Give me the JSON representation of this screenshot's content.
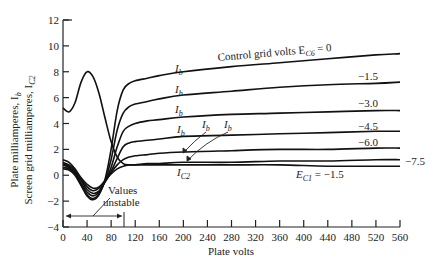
{
  "chart_data": {
    "type": "line",
    "title": "",
    "xlabel": "Plate volts",
    "ylabel_lines": [
      "Plate milliamperes, I_b",
      "Screen grid milliamperes, I_C2"
    ],
    "xlim": [
      0,
      560
    ],
    "ylim": [
      -4,
      12
    ],
    "x_ticks": [
      0,
      40,
      80,
      120,
      160,
      200,
      240,
      280,
      320,
      360,
      400,
      440,
      480,
      520,
      560
    ],
    "y_ticks": [
      -4,
      -2,
      0,
      2,
      4,
      6,
      8,
      10,
      12
    ],
    "grid": false,
    "legend": "inline labels",
    "x": [
      0,
      10,
      20,
      30,
      40,
      50,
      60,
      70,
      80,
      90,
      100,
      110,
      120,
      140,
      160,
      200,
      280,
      360,
      440,
      520,
      560
    ],
    "series": [
      {
        "name": "E_C6 = 0",
        "label": "Control grid volts E_C6 = 0",
        "values": [
          0.5,
          0.4,
          0.0,
          -0.8,
          -1.6,
          -1.9,
          -1.5,
          -0.3,
          2.0,
          5.0,
          6.6,
          7.1,
          7.3,
          7.5,
          7.7,
          8.0,
          8.4,
          8.7,
          9.0,
          9.3,
          9.4
        ]
      },
      {
        "name": "E_C6 = -1.5",
        "label": "-1.5",
        "values": [
          0.6,
          0.5,
          0.1,
          -0.7,
          -1.5,
          -1.8,
          -1.4,
          -0.4,
          1.2,
          3.5,
          4.8,
          5.3,
          5.5,
          5.7,
          5.9,
          6.2,
          6.5,
          6.8,
          7.0,
          7.1,
          7.2
        ]
      },
      {
        "name": "E_C6 = -3.0",
        "label": "-3.0",
        "values": [
          0.8,
          0.6,
          0.2,
          -0.6,
          -1.3,
          -1.6,
          -1.3,
          -0.5,
          0.6,
          2.2,
          3.4,
          3.8,
          4.0,
          4.2,
          4.3,
          4.5,
          4.7,
          4.8,
          4.9,
          5.0,
          5.0
        ]
      },
      {
        "name": "E_C6 = -4.5",
        "label": "-4.5",
        "values": [
          0.9,
          0.7,
          0.3,
          -0.4,
          -1.1,
          -1.4,
          -1.2,
          -0.5,
          0.3,
          1.3,
          2.2,
          2.5,
          2.6,
          2.7,
          2.8,
          3.0,
          3.1,
          3.2,
          3.3,
          3.4,
          3.4
        ]
      },
      {
        "name": "E_C6 = -6.0",
        "label": "-6.0",
        "values": [
          1.0,
          0.8,
          0.4,
          -0.3,
          -0.9,
          -1.2,
          -1.0,
          -0.5,
          0.2,
          0.8,
          1.2,
          1.4,
          1.5,
          1.6,
          1.7,
          1.8,
          1.9,
          2.0,
          2.0,
          2.1,
          2.1
        ]
      },
      {
        "name": "E_C6 = -7.5",
        "label": "-7.5",
        "values": [
          1.2,
          1.0,
          0.5,
          -0.2,
          -0.7,
          -1.0,
          -0.9,
          -0.4,
          0.1,
          0.5,
          0.7,
          0.8,
          0.8,
          0.9,
          0.9,
          1.0,
          1.0,
          1.1,
          1.1,
          1.2,
          1.2
        ]
      },
      {
        "name": "I_C2 (E_C1 = -1.5)",
        "label": "E_C1 = -1.5",
        "values": [
          5.2,
          4.9,
          5.6,
          7.2,
          8.0,
          7.6,
          6.3,
          4.4,
          2.6,
          1.4,
          0.9,
          0.8,
          0.8,
          0.8,
          0.8,
          0.8,
          0.8,
          0.8,
          0.7,
          0.7,
          0.7
        ]
      }
    ],
    "annotations": [
      {
        "text": "Values unstable",
        "x_range": [
          0,
          95
        ],
        "y": -3.2
      },
      {
        "text": "I_b",
        "note": "curve labels on plate current curves"
      },
      {
        "text": "I_C2",
        "note": "screen grid current curve label"
      }
    ]
  },
  "labels": {
    "xlabel": "Plate volts",
    "ylabel_1": "Plate milliamperes, I",
    "ylabel_1_sub": "b",
    "ylabel_2": "Screen grid milliamperes, I",
    "ylabel_2_sub": "C2",
    "control_grid": "Control grid volts E",
    "control_grid_sub": "C6",
    "control_grid_val": " = 0",
    "ib": "I",
    "ib_sub": "b",
    "ic2": "I",
    "ic2_sub": "C2",
    "ec1": "E",
    "ec1_sub": "C1",
    "ec1_val": " = −1.5",
    "values_unstable_1": "Values",
    "values_unstable_2": "unstable",
    "m15": "−1.5",
    "m30": "−3.0",
    "m45": "−4.5",
    "m60": "−6.0",
    "m75": "−7.5"
  }
}
